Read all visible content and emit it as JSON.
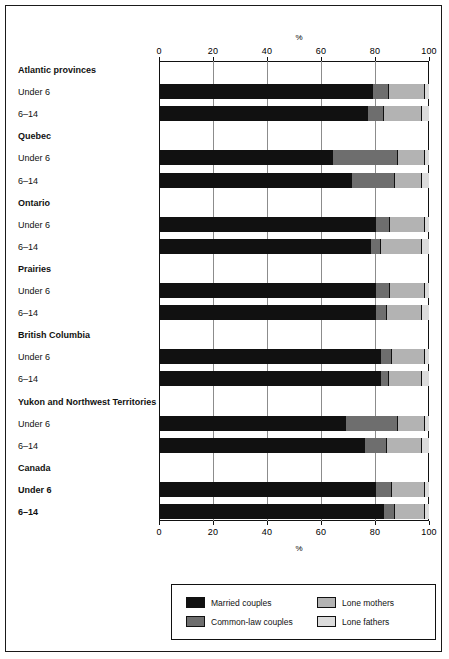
{
  "chart_data": {
    "type": "bar",
    "subtype": "stacked-horizontal-100",
    "title": "",
    "xlabel": "%",
    "ylabel": "",
    "xlim": [
      0,
      100
    ],
    "xticks": [
      0,
      20,
      40,
      60,
      80,
      100
    ],
    "xtick_labels": [
      "0",
      "20",
      "40",
      "60",
      "80",
      "100"
    ],
    "axis_label_top": "%",
    "axis_label_bottom": "%",
    "grid": true,
    "grid_orientation": "vertical",
    "legend_position": "bottom",
    "series": [
      {
        "name": "Married couples",
        "key": "married",
        "color": "#111111"
      },
      {
        "name": "Common-law couples",
        "key": "commonlaw",
        "color": "#6e6e6e"
      },
      {
        "name": "Lone mothers",
        "key": "lonemother",
        "color": "#b3b3b3"
      },
      {
        "name": "Lone fathers",
        "key": "lonefather",
        "color": "#dcdcdc"
      }
    ],
    "groups": [
      {
        "label": "Atlantic provinces",
        "bold_sub_labels": false,
        "rows": [
          {
            "label": "Under 6",
            "values": [
              79,
              6,
              13,
              2
            ]
          },
          {
            "label": "6–14",
            "values": [
              77,
              6,
              14,
              3
            ]
          }
        ]
      },
      {
        "label": "Quebec",
        "bold_sub_labels": false,
        "rows": [
          {
            "label": "Under 6",
            "values": [
              64,
              24,
              10,
              2
            ]
          },
          {
            "label": "6–14",
            "values": [
              71,
              16,
              10,
              3
            ]
          }
        ]
      },
      {
        "label": "Ontario",
        "bold_sub_labels": false,
        "rows": [
          {
            "label": "Under 6",
            "values": [
              80,
              5,
              13,
              2
            ]
          },
          {
            "label": "6–14",
            "values": [
              78,
              4,
              15,
              3
            ]
          }
        ]
      },
      {
        "label": "Prairies",
        "bold_sub_labels": false,
        "rows": [
          {
            "label": "Under 6",
            "values": [
              80,
              5,
              13,
              2
            ]
          },
          {
            "label": "6–14",
            "values": [
              80,
              4,
              13,
              3
            ]
          }
        ]
      },
      {
        "label": "British Columbia",
        "bold_sub_labels": false,
        "rows": [
          {
            "label": "Under 6",
            "values": [
              82,
              4,
              12,
              2
            ]
          },
          {
            "label": "6–14",
            "values": [
              82,
              3,
              12,
              3
            ]
          }
        ]
      },
      {
        "label": "Yukon and Northwest Territories",
        "bold_sub_labels": false,
        "rows": [
          {
            "label": "Under 6",
            "values": [
              69,
              19,
              10,
              2
            ]
          },
          {
            "label": "6–14",
            "values": [
              76,
              8,
              13,
              3
            ]
          }
        ]
      },
      {
        "label": "Canada",
        "bold_sub_labels": true,
        "rows": [
          {
            "label": "Under 6",
            "values": [
              80,
              6,
              12,
              2
            ]
          },
          {
            "label": "6–14",
            "values": [
              83,
              4,
              11,
              2
            ]
          }
        ]
      }
    ]
  },
  "legend": {
    "entries": [
      {
        "label": "Married couples",
        "swatch": "sw-married"
      },
      {
        "label": "Common-law couples",
        "swatch": "sw-commonlaw"
      },
      {
        "label": "Lone mothers",
        "swatch": "sw-lonemother"
      },
      {
        "label": "Lone fathers",
        "swatch": "sw-lonefather"
      }
    ]
  }
}
